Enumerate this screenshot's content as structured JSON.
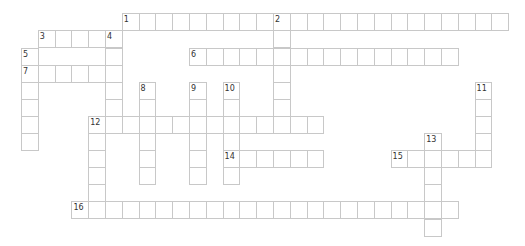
{
  "puzzle": {
    "type": "crossword",
    "grid": {
      "origin_x": 21,
      "origin_y": 13.3,
      "cell_w": 16.8,
      "cell_h": 17.1
    },
    "line_color": "#c8c8c8",
    "entries": [
      {
        "number": "1",
        "dir": "across",
        "row": 0,
        "col": 6,
        "length": 23
      },
      {
        "number": "2",
        "dir": "down",
        "row": 0,
        "col": 15,
        "length": 7
      },
      {
        "number": "3",
        "dir": "across",
        "row": 1,
        "col": 1,
        "length": 5
      },
      {
        "number": "4",
        "dir": "down",
        "row": 1,
        "col": 5,
        "length": 6
      },
      {
        "number": "5",
        "dir": "down",
        "row": 2,
        "col": 0,
        "length": 6
      },
      {
        "number": "6",
        "dir": "across",
        "row": 2,
        "col": 10,
        "length": 16
      },
      {
        "number": "7",
        "dir": "across",
        "row": 3,
        "col": 0,
        "length": 6
      },
      {
        "number": "8",
        "dir": "down",
        "row": 4,
        "col": 7,
        "length": 6
      },
      {
        "number": "9",
        "dir": "down",
        "row": 4,
        "col": 10,
        "length": 6
      },
      {
        "number": "10",
        "dir": "down",
        "row": 4,
        "col": 12,
        "length": 6
      },
      {
        "number": "11",
        "dir": "down",
        "row": 4,
        "col": 27,
        "length": 5
      },
      {
        "number": "12",
        "dir": "across",
        "row": 6,
        "col": 4,
        "length": 14
      },
      {
        "number": "12",
        "dir": "down",
        "row": 6,
        "col": 4,
        "length": 6
      },
      {
        "number": "13",
        "dir": "down",
        "row": 7,
        "col": 24,
        "length": 6
      },
      {
        "number": "14",
        "dir": "across",
        "row": 8,
        "col": 12,
        "length": 6
      },
      {
        "number": "15",
        "dir": "across",
        "row": 8,
        "col": 22,
        "length": 6
      },
      {
        "number": "16",
        "dir": "across",
        "row": 11,
        "col": 3,
        "length": 23
      }
    ]
  }
}
